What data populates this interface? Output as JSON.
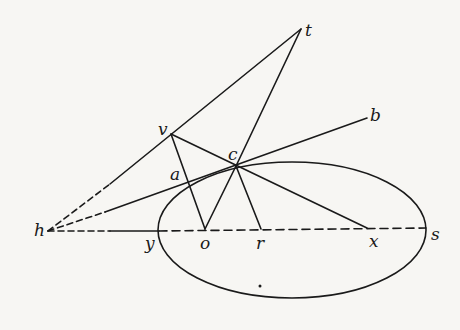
{
  "diagram": {
    "type": "geometric-construction",
    "stroke_color": "#1a1a1a",
    "background": "#f7f6f3",
    "ellipse": {
      "cx": 292,
      "cy": 230,
      "rx": 134,
      "ry": 68
    },
    "points": {
      "h": {
        "label": "h",
        "x": 48,
        "y": 231
      },
      "y": {
        "label": "y",
        "x": 159,
        "y": 231
      },
      "o": {
        "label": "o",
        "x": 205,
        "y": 231
      },
      "r": {
        "label": "r",
        "x": 261,
        "y": 230
      },
      "x": {
        "label": "x",
        "x": 367,
        "y": 229
      },
      "s": {
        "label": "s",
        "x": 426,
        "y": 228
      },
      "c": {
        "label": "c",
        "x": 236,
        "y": 166
      },
      "v": {
        "label": "v",
        "x": 171,
        "y": 134
      },
      "t": {
        "label": "t",
        "x": 301,
        "y": 29
      },
      "b": {
        "label": "b",
        "x": 367,
        "y": 118
      },
      "a": {
        "label": "a"
      }
    },
    "segments": [
      {
        "from": "h",
        "to": "t",
        "style": "dashed-then-solid"
      },
      {
        "from": "h",
        "to": "b",
        "style": "dashed-then-solid"
      },
      {
        "from": "h",
        "to": "s",
        "style": "dashed-with-solid-section"
      },
      {
        "from": "v",
        "to": "o",
        "style": "solid"
      },
      {
        "from": "v",
        "to": "x",
        "style": "solid"
      },
      {
        "from": "c",
        "to": "t",
        "style": "solid"
      },
      {
        "from": "c",
        "to": "o",
        "style": "solid"
      },
      {
        "from": "c",
        "to": "r",
        "style": "solid"
      }
    ]
  }
}
